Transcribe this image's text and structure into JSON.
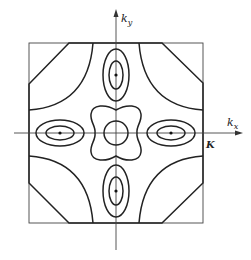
{
  "figure": {
    "type": "Brillouin zone constant-energy contour diagram",
    "axes": {
      "vertical_label": "k",
      "vertical_subscript": "y",
      "horizontal_label": "k",
      "horizontal_subscript": "x",
      "zone_boundary_label": "K"
    },
    "features": [
      {
        "name": "central-circle",
        "description": "circle around origin"
      },
      {
        "name": "central-wavy-contour",
        "description": "four-lobed contour around origin"
      },
      {
        "name": "valley-top",
        "description": "nested ellipses along +ky",
        "levels": 2
      },
      {
        "name": "valley-bottom",
        "description": "nested ellipses along -ky",
        "levels": 2
      },
      {
        "name": "valley-left",
        "description": "nested ellipses along -kx",
        "levels": 2
      },
      {
        "name": "valley-right",
        "description": "nested ellipses along +kx",
        "levels": 2
      },
      {
        "name": "corner-arcs",
        "description": "quarter arcs at zone corners",
        "count": 4
      },
      {
        "name": "zone-boundary-octagon",
        "description": "truncated-corner zone boundary"
      }
    ],
    "colors": {
      "line": "#222222",
      "background": "#ffffff"
    }
  }
}
